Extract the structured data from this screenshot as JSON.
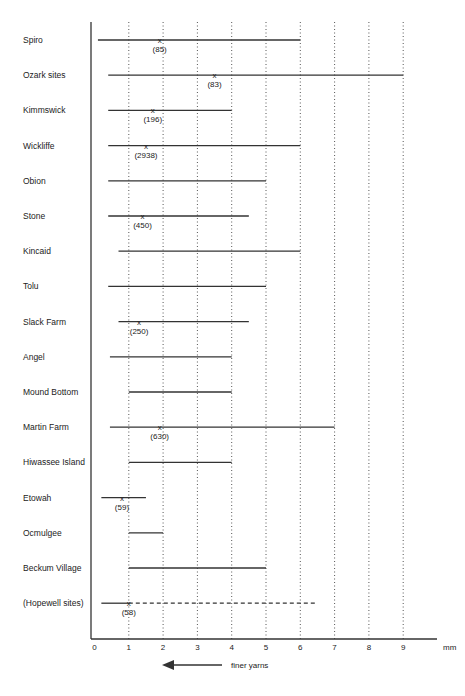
{
  "chart_data": {
    "type": "range",
    "title": "",
    "xlabel": "mm",
    "ylabel": "",
    "xlim": [
      0,
      9.5
    ],
    "x_ticks": [
      "0",
      "1",
      "2",
      "3",
      "4",
      "5",
      "6",
      "7",
      "8",
      "9"
    ],
    "x_unit_label": "mm",
    "grid": "vertical dotted lines at 1-9",
    "annotation": "finer yarns",
    "annotation_arrow": "left",
    "series": [
      {
        "site": "Spiro",
        "min": 0.1,
        "max": 6.0,
        "mean": 1.9,
        "n": "(85)",
        "dashed": false
      },
      {
        "site": "Ozark sites",
        "min": 0.4,
        "max": 9.0,
        "mean": 3.5,
        "n": "(83)",
        "dashed": false
      },
      {
        "site": "Kimmswick",
        "min": 0.4,
        "max": 4.0,
        "mean": 1.7,
        "n": "(196)",
        "dashed": false
      },
      {
        "site": "Wickliffe",
        "min": 0.4,
        "max": 6.0,
        "mean": 1.5,
        "n": "(2938)",
        "dashed": false
      },
      {
        "site": "Obion",
        "min": 0.4,
        "max": 5.0,
        "mean": null,
        "n": "",
        "dashed": false
      },
      {
        "site": "Stone",
        "min": 0.4,
        "max": 4.5,
        "mean": 1.4,
        "n": "(450)",
        "dashed": false
      },
      {
        "site": "Kincaid",
        "min": 0.7,
        "max": 6.0,
        "mean": null,
        "n": "",
        "dashed": false
      },
      {
        "site": "Tolu",
        "min": 0.4,
        "max": 5.0,
        "mean": null,
        "n": "",
        "dashed": false
      },
      {
        "site": "Slack Farm",
        "min": 0.7,
        "max": 4.5,
        "mean": 1.3,
        "n": "(250)",
        "dashed": false
      },
      {
        "site": "Angel",
        "min": 0.45,
        "max": 4.0,
        "mean": null,
        "n": "",
        "dashed": false
      },
      {
        "site": "Mound Bottom",
        "min": 1.0,
        "max": 4.0,
        "mean": null,
        "n": "",
        "dashed": false
      },
      {
        "site": "Martin Farm",
        "min": 0.45,
        "max": 7.0,
        "mean": 1.9,
        "n": "(630)",
        "dashed": false
      },
      {
        "site": "Hiwassee Island",
        "min": 1.0,
        "max": 4.0,
        "mean": null,
        "n": "",
        "dashed": false
      },
      {
        "site": "Etowah",
        "min": 0.2,
        "max": 1.5,
        "mean": 0.8,
        "n": "(59)",
        "dashed": false
      },
      {
        "site": "Ocmulgee",
        "min": 1.0,
        "max": 2.0,
        "mean": null,
        "n": "",
        "dashed": false
      },
      {
        "site": "Beckum Village",
        "min": 1.0,
        "max": 5.0,
        "mean": null,
        "n": "",
        "dashed": false
      },
      {
        "site": "(Hopewell sites)",
        "min": 0.2,
        "max": 1.0,
        "mean": 1.0,
        "n": "(58)",
        "dashed": true,
        "dashed_max": 6.5
      }
    ]
  },
  "legend": {
    "arrow_text": "finer yarns",
    "unit": "mm"
  },
  "colors": {
    "line": "#333333",
    "grid": "#555555",
    "text": "#222222",
    "background": "#ffffff"
  }
}
